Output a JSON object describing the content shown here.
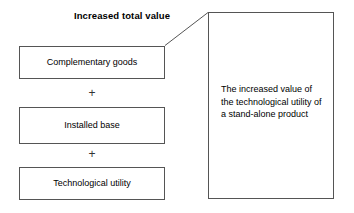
{
  "diagram": {
    "title": "Increased total value",
    "components": [
      {
        "label": "Complementary goods"
      },
      {
        "label": "Installed base"
      },
      {
        "label": "Technological utility"
      }
    ],
    "operators": [
      {
        "symbol": "+"
      },
      {
        "symbol": "+"
      }
    ],
    "callout": {
      "text": "The increased value of the technological utility of a stand-alone product"
    },
    "colors": {
      "background": "#ffffff",
      "border": "#555555",
      "text": "#000000"
    }
  }
}
